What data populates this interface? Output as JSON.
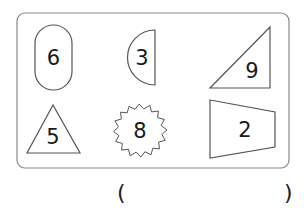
{
  "figure": {
    "shapes": [
      {
        "shape": "capsule",
        "number": "6"
      },
      {
        "shape": "semicircle",
        "number": "3"
      },
      {
        "shape": "right-triangle",
        "number": "9"
      },
      {
        "shape": "triangle",
        "number": "5"
      },
      {
        "shape": "starburst",
        "number": "8"
      },
      {
        "shape": "trapezoid",
        "number": "2"
      }
    ],
    "answer_blank": {
      "open": "(",
      "close": ")"
    }
  },
  "colors": {
    "stroke": "#555555",
    "frame": "#888888",
    "text": "#1a1a1a"
  }
}
